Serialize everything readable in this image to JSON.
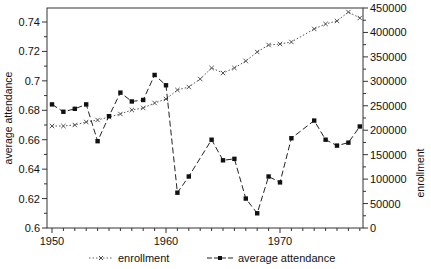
{
  "chart_data": {
    "type": "line",
    "title": "",
    "xlabel": "",
    "ylabel_left": "average attendance",
    "ylabel_right": "enrollment",
    "xlim": [
      1949.5,
      1977.5
    ],
    "ylim_left": [
      0.6,
      0.75
    ],
    "ylim_right": [
      0,
      450000
    ],
    "x_ticks": [
      1950,
      1960,
      1970
    ],
    "y_ticks_left": [
      "0.6",
      "0.62",
      "0.64",
      "0.66",
      "0.68",
      "0.7",
      "0.72",
      "0.74"
    ],
    "y_ticks_right": [
      "0",
      "50000",
      "100000",
      "150000",
      "200000",
      "250000",
      "300000",
      "350000",
      "400000",
      "450000"
    ],
    "grid": false,
    "legend_position": "bottom",
    "x": [
      1950,
      1951,
      1952,
      1953,
      1954,
      1955,
      1956,
      1957,
      1958,
      1959,
      1960,
      1961,
      1962,
      1963,
      1964,
      1965,
      1966,
      1967,
      1968,
      1969,
      1970,
      1971,
      1972,
      1973,
      1974,
      1975,
      1976,
      1977
    ],
    "series": [
      {
        "name": "enrollment",
        "axis": "right",
        "style": "dotted",
        "marker": "x",
        "values": [
          208600,
          208600,
          210700,
          216800,
          220900,
          227000,
          233200,
          241400,
          245500,
          255700,
          263900,
          282300,
          288400,
          304800,
          327300,
          317000,
          327300,
          341600,
          360000,
          374300,
          376400,
          380500,
          null,
          407100,
          417300,
          423500,
          441800,
          429500
        ]
      },
      {
        "name": "average attendance",
        "axis": "left",
        "style": "dashed",
        "marker": "square",
        "values": [
          0.684,
          0.679,
          0.681,
          0.684,
          0.659,
          0.676,
          0.692,
          0.686,
          0.687,
          0.704,
          0.697,
          0.624,
          0.635,
          null,
          0.66,
          0.646,
          0.647,
          0.62,
          0.61,
          0.635,
          0.631,
          0.661,
          null,
          0.673,
          0.66,
          0.656,
          0.658,
          0.669
        ]
      }
    ]
  },
  "legend": {
    "items": [
      {
        "label": "enrollment"
      },
      {
        "label": "average attendance"
      }
    ]
  },
  "colors": {
    "axis": "#333333",
    "enrollment": "#555555",
    "attendance": "#222222"
  }
}
